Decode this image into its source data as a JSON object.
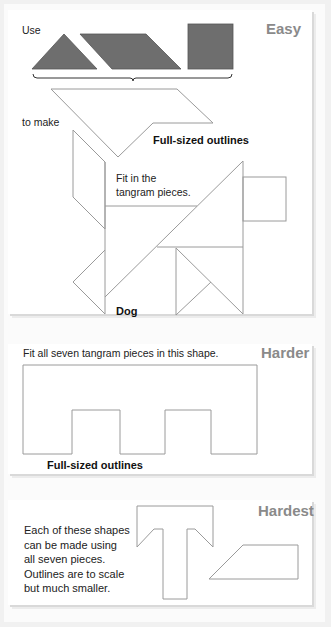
{
  "sections": {
    "easy": {
      "level": "Easy",
      "use_label": "Use",
      "to_make_label": "to make",
      "outline_label": "Full-sized outlines",
      "instruction": [
        "Fit in the",
        "tangram pieces."
      ],
      "shape_name": "Dog"
    },
    "harder": {
      "level": "Harder",
      "instruction": "Fit all seven tangram pieces in this shape.",
      "outline_label": "Full-sized outlines"
    },
    "hardest": {
      "level": "Hardest",
      "description": [
        "Each of these shapes",
        "can be made using",
        "all seven pieces.",
        "Outlines are to scale",
        "but much smaller."
      ]
    }
  },
  "colors": {
    "piece_fill": "#6e6e6e",
    "outline": "#9a9a9a",
    "level_text": "#8a8a8a"
  },
  "pieces": [
    "triangle",
    "parallelogram",
    "square"
  ]
}
